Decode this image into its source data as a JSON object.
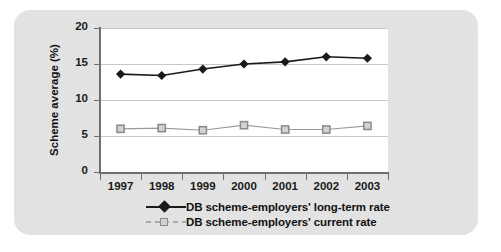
{
  "chart_data": {
    "type": "line",
    "title": "",
    "xlabel": "",
    "ylabel": "Scheme average (%)",
    "categories": [
      "1997",
      "1998",
      "1999",
      "2000",
      "2001",
      "2002",
      "2003"
    ],
    "ylim": [
      0,
      20
    ],
    "yticks": [
      "0",
      "5",
      "10",
      "15",
      "20"
    ],
    "ytick_values": [
      0,
      5,
      10,
      15,
      20
    ],
    "grid": "horizontal",
    "legend_position": "bottom",
    "series": [
      {
        "name": "DB scheme-employers' long-term rate",
        "marker": "diamond",
        "color": "#1a1a1a",
        "values": [
          13.6,
          13.4,
          14.3,
          15.0,
          15.3,
          16.0,
          15.8
        ]
      },
      {
        "name": "DB scheme-employers' current rate",
        "marker": "square-open",
        "color": "#9a9a9a",
        "values": [
          6.0,
          6.1,
          5.8,
          6.5,
          5.9,
          5.9,
          6.4
        ]
      }
    ]
  },
  "legend": {
    "items": [
      {
        "label": "DB scheme-employers' long-term rate",
        "marker": "diamond-marker"
      },
      {
        "label": "DB scheme-employers' current rate",
        "marker": "square-marker"
      }
    ]
  },
  "colors": {
    "panel_background": "#e2e2e2",
    "plot_background": "#ffffff",
    "axis": "#6e6e6e",
    "gridline": "#c8c8c8",
    "series_long_term": "#1a1a1a",
    "series_current": "#9a9a9a"
  }
}
